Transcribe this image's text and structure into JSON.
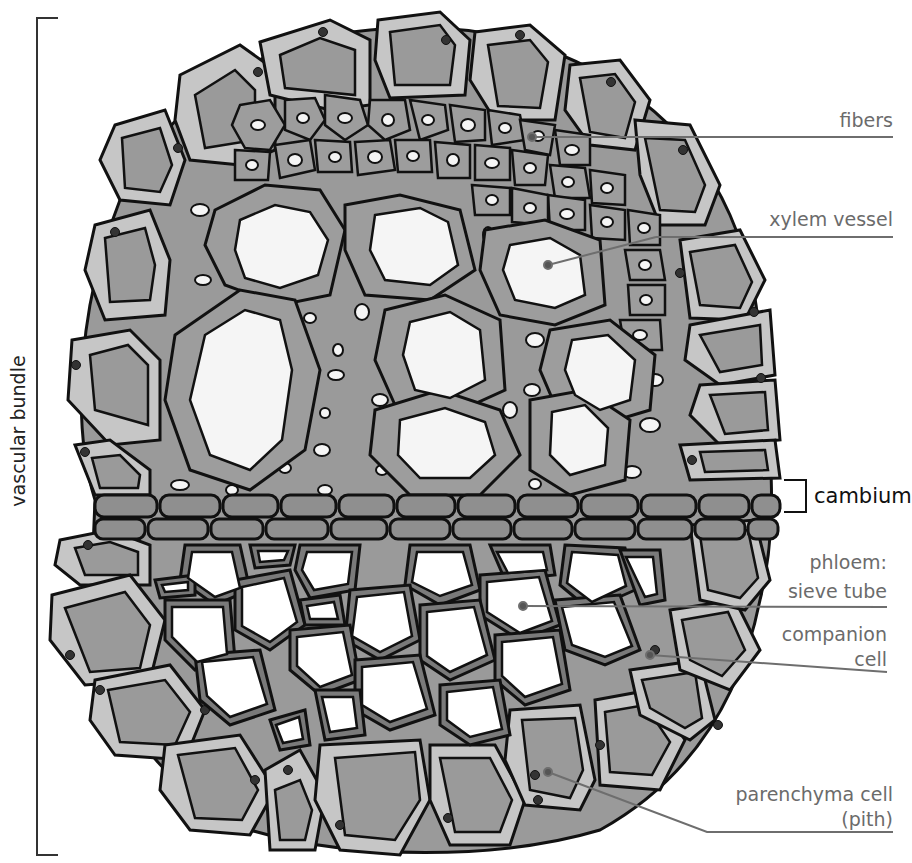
{
  "figure": {
    "colors": {
      "outline": "#111111",
      "parenchyma_wall": "#c6c6c6",
      "parenchyma_content": "#9a9a9a",
      "xylem_wall": "#9d9d9d",
      "lumen": "#f5f5f5",
      "cambium": "#8f8f8f",
      "phloem_wall": "#7a7a7a",
      "leader_line": "#6e6e6e",
      "label_text": "#6b6b6b"
    }
  },
  "bracket_left": {
    "label": "vascular bundle"
  },
  "labels": {
    "fibers": "fibers",
    "xylem_vessel": "xylem vessel",
    "cambium": "cambium",
    "phloem_line1": "phloem:",
    "phloem_line2": "sieve tube",
    "companion_line1": "companion",
    "companion_line2": "cell",
    "parenchyma_line1": "parenchyma cell",
    "parenchyma_line2": "(pith)"
  }
}
